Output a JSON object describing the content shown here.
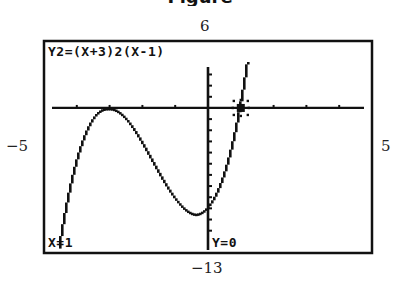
{
  "chart_data": {
    "type": "line",
    "title": "",
    "equation_label": "Y2=(X+3)2(X-1)",
    "function": "(x+3)^2*(x-1)",
    "window": {
      "xmin": -5,
      "xmax": 5,
      "ymin": -13,
      "ymax": 6,
      "xscl": 1,
      "yscl": 1
    },
    "xlim": [
      -5,
      5
    ],
    "ylim": [
      -13,
      6
    ],
    "xlabel": "",
    "ylabel": "",
    "grid": false,
    "trace_cursor": {
      "x": 1,
      "y": 0,
      "x_label": "X=1",
      "y_label": "Y=0"
    },
    "series": [
      {
        "name": "Y2",
        "x": [
          -4.6,
          -4.5,
          -4,
          -3.5,
          -3,
          -2.5,
          -2,
          -1.5,
          -1,
          -0.5,
          -0.33,
          0,
          0.5,
          1,
          1.5,
          1.8
        ],
        "values": [
          -14.34,
          -12.38,
          -5,
          -1.13,
          0,
          -0.88,
          -3,
          -5.63,
          -8,
          -9.38,
          -9.48,
          -9,
          -6.13,
          0,
          10.13,
          18.43
        ]
      }
    ],
    "window_labels": {
      "ymax": "6",
      "ymin": "−13",
      "xmin": "−5",
      "xmax": "5"
    },
    "caption_fragment": "Figure"
  },
  "colors": {
    "ink": "#111111",
    "background": "#ffffff"
  }
}
